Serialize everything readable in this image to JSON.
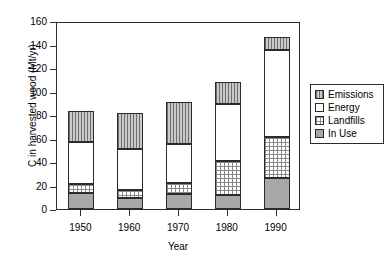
{
  "chart_data": {
    "type": "bar",
    "subtype": "stacked-vertical",
    "title": "",
    "xlabel": "Year",
    "ylabel": "C in harvested wood (Mt/yr)",
    "categories": [
      "1950",
      "1960",
      "1970",
      "1980",
      "1990"
    ],
    "ylim": [
      0,
      160
    ],
    "yticks": [
      0,
      20,
      40,
      60,
      80,
      100,
      120,
      140,
      160
    ],
    "ytick_labels": [
      "0",
      "20",
      "40",
      "60",
      "80",
      "100",
      "120",
      "140",
      "160"
    ],
    "grid": false,
    "legend_position": "right-outside",
    "stack_order_bottom_to_top": [
      "In Use",
      "Landfills",
      "Energy",
      "Emissions"
    ],
    "series": [
      {
        "name": "In Use",
        "pattern": "solid-gray",
        "color": "#a8a8a8",
        "values": [
          14,
          9,
          13,
          12,
          26
        ]
      },
      {
        "name": "Landfills",
        "pattern": "dotted-grid",
        "color": "#ffffff",
        "values": [
          7,
          7,
          9,
          29,
          35
        ]
      },
      {
        "name": "Energy",
        "pattern": "white",
        "color": "#ffffff",
        "values": [
          36,
          35,
          33,
          48,
          74
        ]
      },
      {
        "name": "Emissions",
        "pattern": "vertical-hatch",
        "color": "#c9c9c9",
        "values": [
          26,
          31,
          36,
          19,
          11
        ]
      }
    ],
    "totals": [
      83,
      82,
      91,
      108,
      146
    ],
    "cumulative_tops": {
      "1950": {
        "In Use": 14,
        "Landfills": 21,
        "Energy": 57,
        "Emissions": 83
      },
      "1960": {
        "In Use": 9,
        "Landfills": 16,
        "Energy": 51,
        "Emissions": 82
      },
      "1970": {
        "In Use": 13,
        "Landfills": 22,
        "Energy": 55,
        "Emissions": 91
      },
      "1980": {
        "In Use": 12,
        "Landfills": 41,
        "Energy": 89,
        "Emissions": 108
      },
      "1990": {
        "In Use": 26,
        "Landfills": 61,
        "Energy": 135,
        "Emissions": 146
      }
    }
  },
  "legend": {
    "items": [
      {
        "label": "Emissions",
        "swatch": "vertical-hatch-swatch"
      },
      {
        "label": "Energy",
        "swatch": "white-swatch"
      },
      {
        "label": "Landfills",
        "swatch": "dotted-swatch"
      },
      {
        "label": "In Use",
        "swatch": "solid-gray-swatch"
      }
    ]
  }
}
